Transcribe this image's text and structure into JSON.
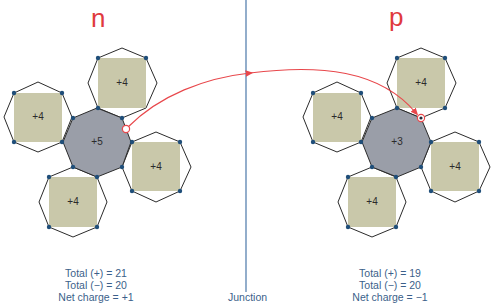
{
  "diagram": {
    "left": {
      "title": "n",
      "center_charge": "+5",
      "neighbor_charges": [
        "+4",
        "+4",
        "+4",
        "+4"
      ],
      "carrier": "hole",
      "totals": {
        "positive": "Total (+) = 21",
        "negative": "Total (−) = 20",
        "net": "Net charge = +1"
      }
    },
    "right": {
      "title": "p",
      "center_charge": "+3",
      "neighbor_charges": [
        "+4",
        "+4",
        "+4",
        "+4"
      ],
      "carrier": "electron",
      "totals": {
        "positive": "Total (+) = 19",
        "negative": "Total (−) = 20",
        "net": "Net charge = −1"
      }
    },
    "junction_label": "Junction",
    "colors": {
      "title": "#e03a3e",
      "arrow": "#e8474b",
      "junction_line": "#4a77a8",
      "text": "#3b5f8a",
      "core_gray": "#9a9ea8",
      "neighbor_square": "#c9c8aa",
      "dot": "#1f4e79",
      "outline": "#2b2b2b"
    }
  }
}
